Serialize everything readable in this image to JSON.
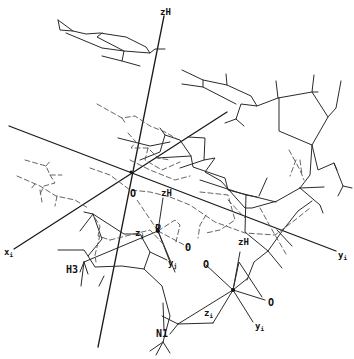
{
  "figure": {
    "type": "molecular-stereo-diagram",
    "colors": {
      "background": "#ffffff",
      "line": "#2a2a2a",
      "axis": "#1a1a1a",
      "dashed": "#555555"
    },
    "axes": {
      "zH_main": "zH",
      "x_i": "x",
      "x_i_sub": "i",
      "y_i": "y",
      "y_i_sub": "i"
    },
    "labels": {
      "origin_O": "O",
      "p1_zH": "zH",
      "p1_P": "P",
      "p1_zj": "z",
      "p1_zj_sub": "j",
      "p1_yj": "y",
      "p1_yj_sub": "j",
      "p1_O": "O",
      "H3": "H3",
      "N1": "N1",
      "p2_zH": "zH",
      "p2_O_left": "O",
      "p2_O_right": "O",
      "p2_P": "P",
      "p2_zi": "z",
      "p2_zi_sub": "i",
      "p2_yi": "y",
      "p2_yi_sub": "i"
    }
  }
}
